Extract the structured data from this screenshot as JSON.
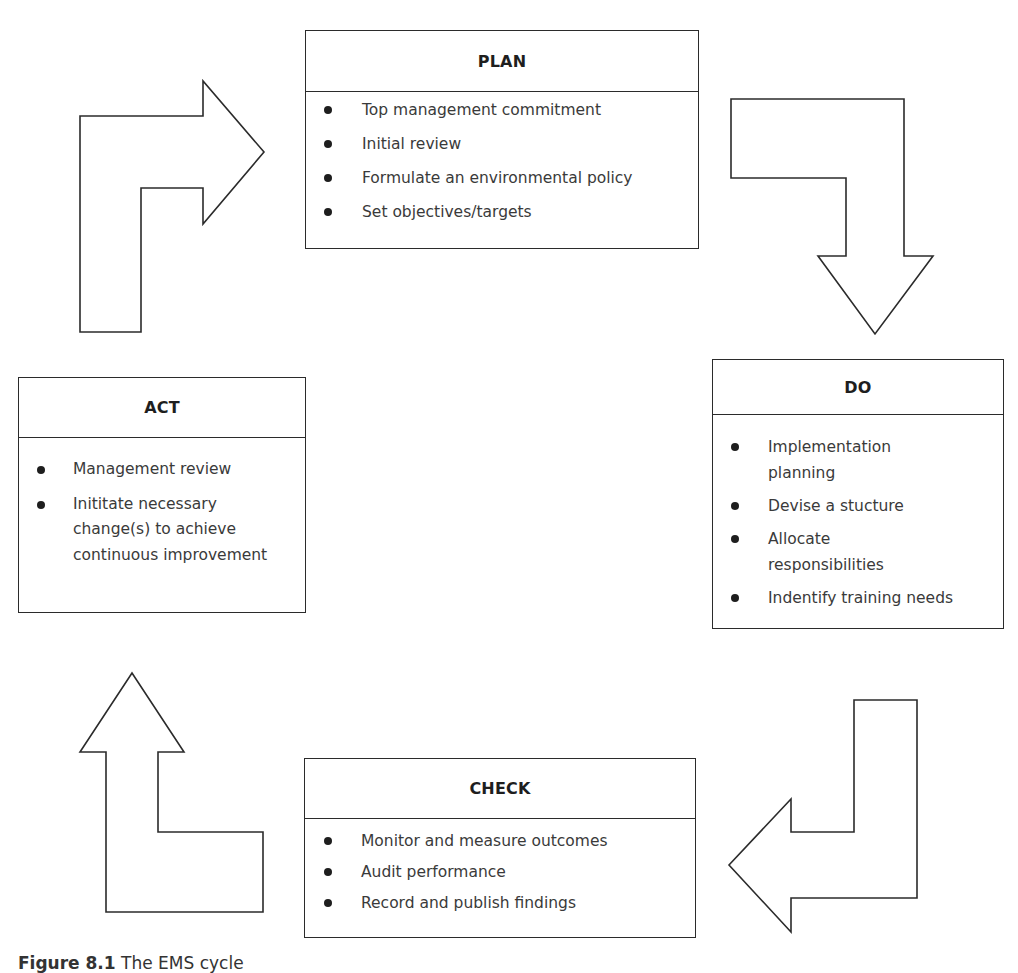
{
  "diagram": {
    "stages": {
      "plan": {
        "heading": "PLAN",
        "items": [
          "Top management commitment",
          "Initial review",
          "Formulate an environmental policy",
          "Set objectives/targets"
        ]
      },
      "do": {
        "heading": "DO",
        "items": [
          "Implementation planning",
          "Devise a stucture",
          "Allocate responsibilities",
          "Indentify training needs"
        ]
      },
      "check": {
        "heading": "CHECK",
        "items": [
          "Monitor and measure outcomes",
          "Audit performance",
          "Record and publish findings"
        ]
      },
      "act": {
        "heading": "ACT",
        "items": [
          "Management review",
          "Inititate necessary change(s) to achieve continuous improvement"
        ]
      }
    },
    "arrows": [
      {
        "name": "act-to-plan",
        "direction": "up-then-right"
      },
      {
        "name": "plan-to-do",
        "direction": "right-then-down"
      },
      {
        "name": "do-to-check",
        "direction": "down-then-left"
      },
      {
        "name": "check-to-act",
        "direction": "left-then-up"
      }
    ],
    "colors": {
      "stroke": "#2b2b2b",
      "fill": "#ffffff",
      "text": "#3a3a3a",
      "heading": "#1e1e1e"
    }
  },
  "caption": {
    "label": "Figure 8.1",
    "text": "The EMS cycle"
  }
}
